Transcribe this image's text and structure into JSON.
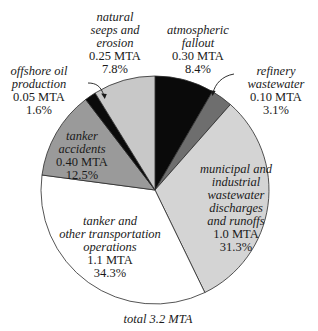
{
  "chart_data": {
    "type": "pie",
    "title": "",
    "total_label": "total 3.2 MTA",
    "start_angle_deg": 0,
    "direction": "clockwise",
    "slices": [
      {
        "label": "atmospheric fallout",
        "value_mta": 0.3,
        "value_text": "0.30 MTA",
        "percent": 8.4,
        "percent_text": "8.4%",
        "color": "#0a0a0a"
      },
      {
        "label": "refinery wastewater",
        "value_mta": 0.1,
        "value_text": "0.10 MTA",
        "percent": 3.1,
        "percent_text": "3.1%",
        "color": "#6e6e6e"
      },
      {
        "label": "municipal and industrial wastewater discharges and runoffs",
        "value_mta": 1.0,
        "value_text": "1.0 MTA",
        "percent": 31.3,
        "percent_text": "31.3%",
        "color": "#d4d4d4"
      },
      {
        "label": "tanker and other transportation operations",
        "value_mta": 1.1,
        "value_text": "1.1 MTA",
        "percent": 34.3,
        "percent_text": "34.3%",
        "color": "#ffffff"
      },
      {
        "label": "tanker accidents",
        "value_mta": 0.4,
        "value_text": "0.40 MTA",
        "percent": 12.5,
        "percent_text": "12.5%",
        "color": "#9a9a9a"
      },
      {
        "label": "offshore oil production",
        "value_mta": 0.05,
        "value_text": "0.05 MTA",
        "percent": 1.6,
        "percent_text": "1.6%",
        "color": "#0a0a0a"
      },
      {
        "label": "natural seeps and erosion",
        "value_mta": 0.25,
        "value_text": "0.25 MTA",
        "percent": 7.8,
        "percent_text": "7.8%",
        "color": "#c8c8c8"
      }
    ],
    "total_mta": 3.2
  },
  "labels": {
    "atmospheric": {
      "l1": "atmospheric",
      "l2": "fallout",
      "v": "0.30 MTA",
      "p": "8.4%"
    },
    "refinery": {
      "l1": "refinery",
      "l2": "wastewater",
      "v": "0.10 MTA",
      "p": "3.1%"
    },
    "municipal": {
      "l1": "municipal and",
      "l2": "industrial",
      "l3": "wastewater",
      "l4": "discharges",
      "l5": "and runoffs",
      "v": "1.0 MTA",
      "p": "31.3%"
    },
    "transport": {
      "l1": "tanker and",
      "l2": "other transportation",
      "l3": "operations",
      "v": "1.1 MTA",
      "p": "34.3%"
    },
    "accidents": {
      "l1": "tanker",
      "l2": "accidents",
      "v": "0.40 MTA",
      "p": "12.5%"
    },
    "offshore": {
      "l1": "offshore oil",
      "l2": "production",
      "v": "0.05 MTA",
      "p": "1.6%"
    },
    "seeps": {
      "l1": "natural",
      "l2": "seeps and",
      "l3": "erosion",
      "v": "0.25 MTA",
      "p": "7.8%"
    },
    "total": "total 3.2 MTA"
  }
}
